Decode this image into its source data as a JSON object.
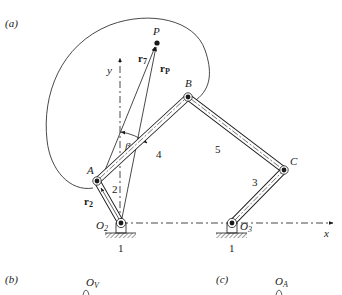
{
  "panels": {
    "a": {
      "label": "(a)"
    },
    "b": {
      "label": "(b)",
      "origin_label": "O",
      "origin_sub": "V"
    },
    "c": {
      "label": "(c)",
      "origin_label": "O",
      "origin_sub": "A"
    }
  },
  "axes": {
    "x_label": "x",
    "y_label": "y"
  },
  "points": {
    "P": "P",
    "A": "A",
    "B": "B",
    "C": "C",
    "O2": {
      "main": "O",
      "sub": "2"
    },
    "O3": {
      "main": "O",
      "sub": "3"
    }
  },
  "links": {
    "ground_left": "1",
    "ground_right": "1",
    "crank": "2",
    "rocker": "3",
    "coupler": "4",
    "link5": "5"
  },
  "vectors": {
    "r7": {
      "main": "r",
      "sub": "7"
    },
    "rP": {
      "main": "r",
      "sub": "P"
    },
    "r2": {
      "main": "r",
      "sub": "2"
    }
  },
  "angles": {
    "beta": "β"
  },
  "colors": {
    "ink": "#1a1a1a",
    "hatch": "#555555",
    "background": "#ffffff"
  }
}
